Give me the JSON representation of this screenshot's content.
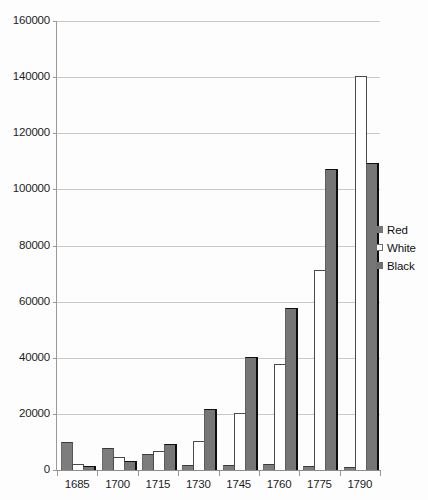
{
  "chart_data": {
    "type": "bar",
    "title": "",
    "subtitle": "",
    "xlabel": "",
    "ylabel": "",
    "categories": [
      "1685",
      "1700",
      "1715",
      "1730",
      "1745",
      "1760",
      "1775",
      "1790"
    ],
    "series": [
      {
        "name": "Red",
        "color": "#767676",
        "values": [
          9800,
          7600,
          5400,
          1400,
          1500,
          1800,
          900,
          800
        ]
      },
      {
        "name": "White",
        "color": "#ffffff",
        "values": [
          1800,
          4400,
          6300,
          9900,
          20000,
          37500,
          71000,
          140000
        ]
      },
      {
        "name": "Black",
        "color": "#6f6f6f",
        "values": [
          1200,
          2700,
          8800,
          21500,
          40000,
          57500,
          107000,
          109000
        ]
      }
    ],
    "ylim": [
      0,
      160000
    ],
    "yticks": [
      0,
      20000,
      40000,
      60000,
      80000,
      100000,
      120000,
      140000,
      160000
    ],
    "ytick_labels": [
      "0",
      "20000",
      "40000",
      "60000",
      "80000",
      "100000",
      "120000",
      "140000",
      "160000"
    ],
    "grid": true,
    "legend_position": "right",
    "legend_entries": [
      "Red",
      "White",
      "Black"
    ]
  },
  "legend": {
    "items": [
      {
        "label": "Red",
        "swatch": "legend-swatch-red"
      },
      {
        "label": "White",
        "swatch": "legend-swatch-white"
      },
      {
        "label": "Black",
        "swatch": "legend-swatch-black"
      }
    ]
  }
}
